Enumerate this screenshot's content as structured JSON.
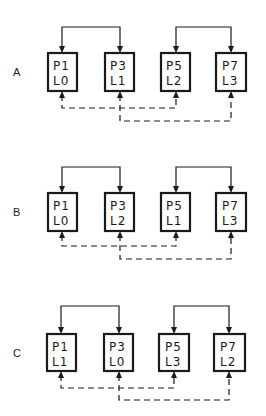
{
  "diagram": {
    "colors": {
      "ink": "#1a1a1a",
      "background": "#ffffff"
    },
    "panels": [
      {
        "label": "A",
        "boxes": [
          {
            "p": "P1",
            "l": "L0"
          },
          {
            "p": "P3",
            "l": "L1"
          },
          {
            "p": "P5",
            "l": "L2"
          },
          {
            "p": "P7",
            "l": "L3"
          }
        ],
        "solid_links": [
          [
            0,
            1
          ],
          [
            2,
            3
          ]
        ],
        "dashed_links": [
          [
            0,
            2
          ],
          [
            1,
            3
          ]
        ]
      },
      {
        "label": "B",
        "boxes": [
          {
            "p": "P1",
            "l": "L0"
          },
          {
            "p": "P3",
            "l": "L2"
          },
          {
            "p": "P5",
            "l": "L1"
          },
          {
            "p": "P7",
            "l": "L3"
          }
        ],
        "solid_links": [
          [
            0,
            1
          ],
          [
            2,
            3
          ]
        ],
        "dashed_links": [
          [
            0,
            2
          ],
          [
            1,
            3
          ]
        ]
      },
      {
        "label": "C",
        "boxes": [
          {
            "p": "P1",
            "l": "L1"
          },
          {
            "p": "P3",
            "l": "L0"
          },
          {
            "p": "P5",
            "l": "L3"
          },
          {
            "p": "P7",
            "l": "L2"
          }
        ],
        "solid_links": [
          [
            0,
            1
          ],
          [
            2,
            3
          ]
        ],
        "dashed_links": [
          [
            0,
            2
          ],
          [
            1,
            3
          ]
        ]
      }
    ]
  }
}
